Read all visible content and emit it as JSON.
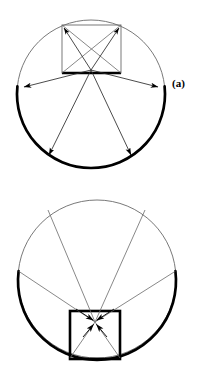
{
  "figure": {
    "background_color": "#ffffff",
    "stroke_color": "#000000",
    "thin_stroke_color": "#555555",
    "width": 199,
    "height": 369
  },
  "panels": [
    {
      "id": "a",
      "label": "(a)",
      "description": "Square inside circle with four arrows pointing outward from the centre toward the bold lower arc",
      "circle": {
        "cx": 91,
        "cy": 94,
        "r": 74,
        "stroke_width": 0.8
      },
      "bold_arc": {
        "start_angle_deg": 186,
        "end_angle_deg": 354,
        "stroke_width": 2.6,
        "note": "lower arc drawn heavy"
      },
      "square": {
        "x": 62,
        "y": 25,
        "width": 59,
        "height": 48,
        "stroke_width": 0.8,
        "bold_edge": "bottom",
        "bold_edge_stroke_width": 2.6
      },
      "convergence_point": {
        "x": 91,
        "y": 70
      },
      "arrow_direction": "outward",
      "arrows": [
        {
          "from": [
            91,
            70
          ],
          "to": [
            22,
            88
          ]
        },
        {
          "from": [
            91,
            70
          ],
          "to": [
            160,
            88
          ]
        },
        {
          "from": [
            91,
            70
          ],
          "to": [
            47,
            157
          ]
        },
        {
          "from": [
            91,
            70
          ],
          "to": [
            133,
            157
          ]
        },
        {
          "from": [
            91,
            70
          ],
          "to": [
            64,
            28
          ]
        },
        {
          "from": [
            91,
            70
          ],
          "to": [
            119,
            28
          ]
        }
      ],
      "diagonals": [
        {
          "from": [
            62,
            25
          ],
          "to": [
            121,
            73
          ]
        },
        {
          "from": [
            121,
            25
          ],
          "to": [
            62,
            73
          ]
        }
      ]
    },
    {
      "id": "b",
      "label": "(b)",
      "description": "Square inside circle with four arrows pointing inward, converging on a point just inside the bold square",
      "circle": {
        "cx": 97,
        "cy": 279,
        "r": 79,
        "stroke_width": 0.8
      },
      "bold_arc": {
        "start_angle_deg": 173,
        "end_angle_deg": 367,
        "stroke_width": 2.6,
        "note": "lower arc drawn heavy"
      },
      "square": {
        "x": 70,
        "y": 311,
        "width": 50,
        "height": 48,
        "stroke_width": 2.6,
        "bold_edge": "all"
      },
      "convergence_point": {
        "x": 95,
        "y": 322
      },
      "arrow_direction": "inward",
      "arrows": [
        {
          "from": [
            18,
            272
          ],
          "to": [
            95,
            322
          ]
        },
        {
          "from": [
            176,
            272
          ],
          "to": [
            95,
            322
          ]
        },
        {
          "from": [
            48,
            201
          ],
          "to": [
            95,
            322
          ]
        },
        {
          "from": [
            146,
            201
          ],
          "to": [
            95,
            322
          ]
        },
        {
          "from": [
            70,
            357
          ],
          "to": [
            95,
            322
          ]
        },
        {
          "from": [
            120,
            357
          ],
          "to": [
            95,
            322
          ]
        }
      ]
    }
  ],
  "colors": {
    "ink": "#000000",
    "thin_line": "#5a5a5a",
    "paper": "#ffffff"
  }
}
